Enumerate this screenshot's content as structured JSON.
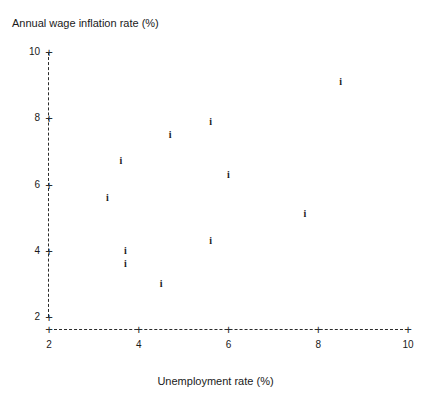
{
  "chart_data": {
    "type": "scatter",
    "title": "",
    "xlabel": "Unemployment rate (%)",
    "ylabel": "Annual wage inflation rate (%)",
    "xlim": [
      2,
      10
    ],
    "ylim": [
      2,
      10
    ],
    "xticks": [
      2,
      4,
      6,
      8,
      10
    ],
    "yticks": [
      2,
      4,
      6,
      8,
      10
    ],
    "xtick_labels": [
      "2",
      "4",
      "6",
      "8",
      "10"
    ],
    "ytick_labels": [
      "2",
      "4",
      "6",
      "8",
      "10"
    ],
    "grid": false,
    "legend": null,
    "marker_glyph": "i",
    "axis_line_style": "dashed",
    "tick_marker_glyph": "+",
    "points": [
      {
        "x": 3.3,
        "y": 5.6
      },
      {
        "x": 3.6,
        "y": 6.7
      },
      {
        "x": 3.7,
        "y": 4.0
      },
      {
        "x": 3.7,
        "y": 3.6
      },
      {
        "x": 4.5,
        "y": 3.0
      },
      {
        "x": 4.7,
        "y": 7.5
      },
      {
        "x": 5.6,
        "y": 7.9
      },
      {
        "x": 5.6,
        "y": 4.3
      },
      {
        "x": 6.0,
        "y": 6.3
      },
      {
        "x": 7.7,
        "y": 5.1
      },
      {
        "x": 8.5,
        "y": 9.1
      }
    ]
  }
}
